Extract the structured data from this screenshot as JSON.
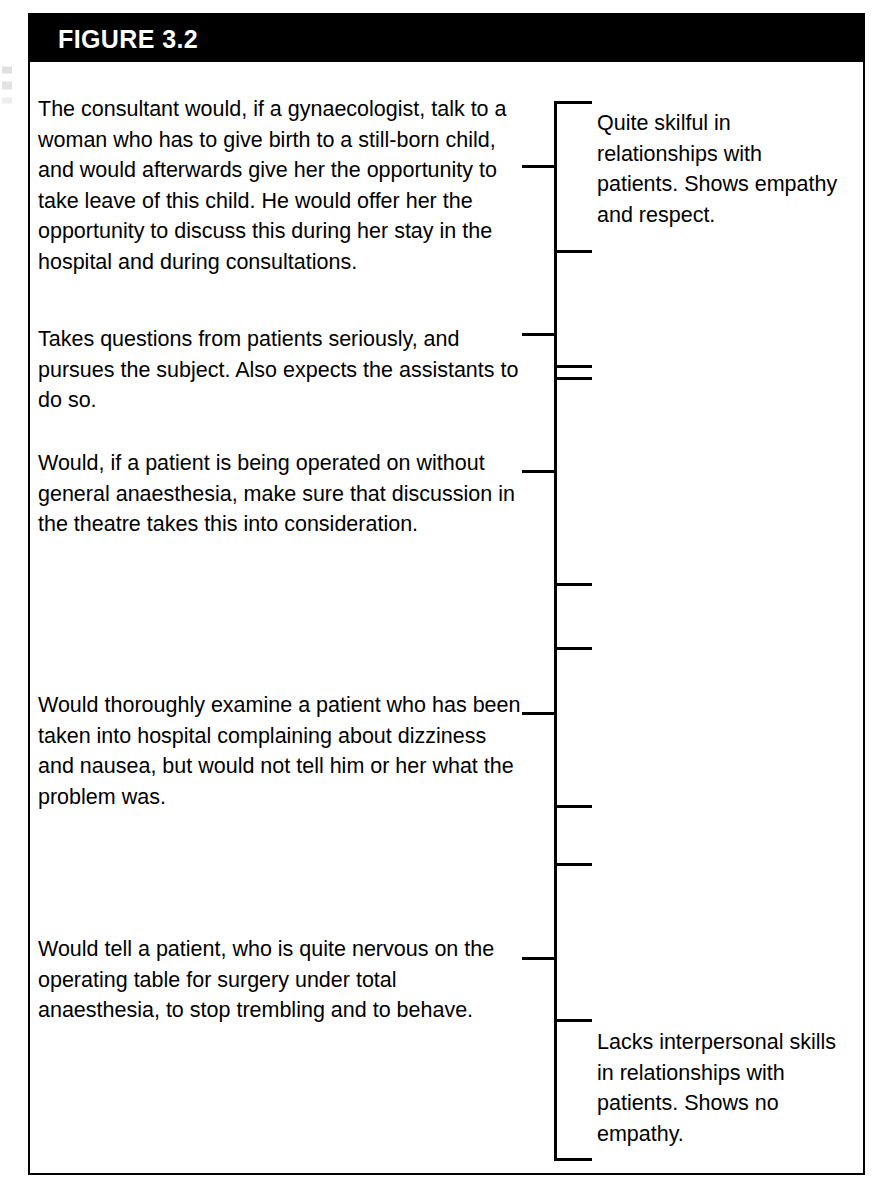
{
  "figure": {
    "label": "FIGURE 3.2",
    "frame_color": "#000000",
    "header_background": "#000000",
    "header_text_color": "#FFFFFF"
  },
  "anchors": [
    {
      "id": "anchor-1",
      "top": 32,
      "text": "The consultant would, if a gynaecologist, talk to a woman who has to give birth to a still-born child, and would afterwards give her the opportunity to take leave of this child. He would offer her the opportunity to discuss this during her stay in the hospital and during consultations."
    },
    {
      "id": "anchor-2",
      "top": 262,
      "text": "Takes questions from patients seriously, and pursues the subject. Also expects the assistants to do so."
    },
    {
      "id": "anchor-3",
      "top": 386,
      "text": "Would, if a patient is being operated on without general anaesthesia, make sure that discussion in the theatre takes this into consideration."
    },
    {
      "id": "anchor-4",
      "top": 628,
      "text": "Would thoroughly examine a patient who has been taken into hospital complaining about dizziness and nausea, but would not tell him or her what the problem was."
    },
    {
      "id": "anchor-5",
      "top": 872,
      "text": "Would tell a patient, who is quite nervous on the operating table for surgery under total anaesthesia, to stop trembling and to behave."
    }
  ],
  "scale": {
    "axis_top": 39,
    "axis_height": 1060,
    "caps": [
      {
        "id": "scale-cap-top",
        "top": 39
      },
      {
        "id": "scale-cap-bottom",
        "top": 1096
      }
    ],
    "ticks": [
      {
        "id": "tick-anchor-1",
        "direction": "left",
        "top": 103
      },
      {
        "id": "tick-point-1",
        "direction": "right",
        "top": 188
      },
      {
        "id": "tick-anchor-2",
        "direction": "left",
        "top": 271
      },
      {
        "id": "tick-point-2",
        "direction": "right",
        "top": 303
      },
      {
        "id": "tick-point-3",
        "direction": "right",
        "top": 315
      },
      {
        "id": "tick-anchor-3",
        "direction": "left",
        "top": 408
      },
      {
        "id": "tick-point-4",
        "direction": "right",
        "top": 521
      },
      {
        "id": "tick-point-5",
        "direction": "right",
        "top": 585
      },
      {
        "id": "tick-anchor-4",
        "direction": "left",
        "top": 650
      },
      {
        "id": "tick-point-6",
        "direction": "right",
        "top": 743
      },
      {
        "id": "tick-point-7",
        "direction": "right",
        "top": 801
      },
      {
        "id": "tick-anchor-5",
        "direction": "left",
        "top": 895
      },
      {
        "id": "tick-point-8",
        "direction": "right",
        "top": 957
      }
    ]
  },
  "descriptors": [
    {
      "id": "descriptor-high",
      "top": 46,
      "text": "Quite skilful in relationships with patients. Shows empathy and respect."
    },
    {
      "id": "descriptor-low",
      "top": 965,
      "text": "Lacks interpersonal skills in relationships with patients. Shows no empathy."
    }
  ]
}
